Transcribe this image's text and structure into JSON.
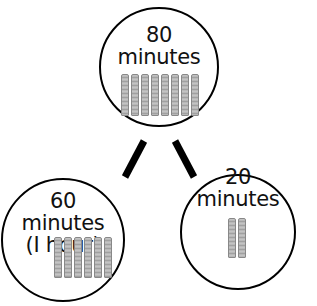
{
  "diagram": {
    "type": "number-bond",
    "nodes": [
      {
        "id": "whole",
        "value": "80",
        "unit": "minutes",
        "extra": "",
        "ten_rods": 8
      },
      {
        "id": "part-left",
        "value": "60",
        "unit": "minutes",
        "extra": "(I hour)",
        "ten_rods": 6
      },
      {
        "id": "part-right",
        "value": "20",
        "unit": "minutes",
        "extra": "",
        "ten_rods": 2
      }
    ],
    "edges": [
      {
        "from": "whole",
        "to": "part-left"
      },
      {
        "from": "whole",
        "to": "part-right"
      }
    ],
    "colors": {
      "stroke": "#000000",
      "rod_fill": "#b8b8b8",
      "background": "#ffffff"
    }
  }
}
